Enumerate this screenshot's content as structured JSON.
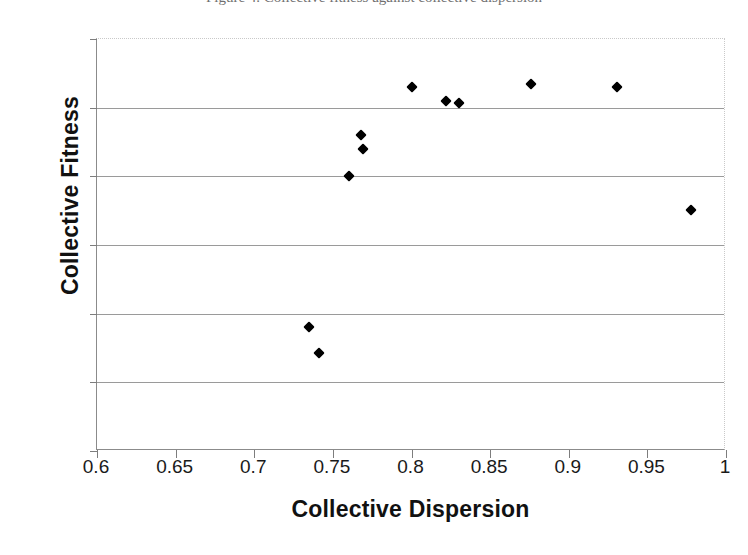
{
  "caption": {
    "text": "Figure 4.  Collective fitness against collective dispersion"
  },
  "chart_data": {
    "type": "scatter",
    "title": "",
    "xlabel": "Collective Dispersion",
    "ylabel": "Collective Fitness",
    "xlim": [
      0.6,
      1
    ],
    "ylim": [
      20,
      80
    ],
    "xticks": [
      "0.6",
      "0.65",
      "0.7",
      "0.75",
      "0.8",
      "0.85",
      "0.9",
      "0.95",
      "1"
    ],
    "xtick_values": [
      0.6,
      0.65,
      0.7,
      0.75,
      0.8,
      0.85,
      0.9,
      0.95,
      1
    ],
    "yticks": [
      "20",
      "30",
      "40",
      "50",
      "60",
      "70",
      "80"
    ],
    "ytick_values": [
      20,
      30,
      40,
      50,
      60,
      70,
      80
    ],
    "grid": "horizontal",
    "legend": "none",
    "marker": "diamond",
    "marker_color": "#000000",
    "points": [
      {
        "x": 0.735,
        "y": 38.1
      },
      {
        "x": 0.741,
        "y": 34.2
      },
      {
        "x": 0.76,
        "y": 60.0
      },
      {
        "x": 0.768,
        "y": 66.0
      },
      {
        "x": 0.769,
        "y": 64.0
      },
      {
        "x": 0.8,
        "y": 73.0
      },
      {
        "x": 0.822,
        "y": 70.9
      },
      {
        "x": 0.83,
        "y": 70.7
      },
      {
        "x": 0.876,
        "y": 73.4
      },
      {
        "x": 0.931,
        "y": 73.0
      },
      {
        "x": 0.978,
        "y": 55.1
      }
    ]
  }
}
